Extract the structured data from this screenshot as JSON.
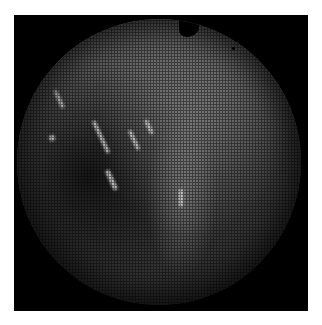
{
  "image": {
    "description": "Circular fiberscope/endoscope view with honeycomb fiber pattern on black square background",
    "background_color": "#000000",
    "page_color": "#ffffff",
    "highlights": [
      {
        "x": 40,
        "y": 70,
        "w": 4,
        "h": 20
      },
      {
        "x": 82,
        "y": 100,
        "w": 4,
        "h": 36
      },
      {
        "x": 92,
        "y": 150,
        "w": 5,
        "h": 22
      },
      {
        "x": 115,
        "y": 110,
        "w": 4,
        "h": 22
      },
      {
        "x": 130,
        "y": 100,
        "w": 4,
        "h": 16
      },
      {
        "x": 32,
        "y": 116,
        "w": 6,
        "h": 6
      },
      {
        "x": 162,
        "y": 170,
        "w": 4,
        "h": 18
      }
    ]
  }
}
